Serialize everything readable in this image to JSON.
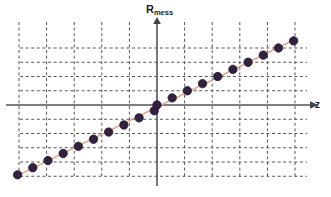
{
  "figure": {
    "background_color": "#ffffff",
    "width": 331,
    "height": 197
  },
  "labels": {
    "y_axis_main": "R",
    "y_axis_sub": "mess",
    "x_axis": "z"
  },
  "style": {
    "marker_color": "#32223f",
    "marker_edge_color": "#241830",
    "line_color": "#e9a183",
    "grid_color": "#555555",
    "axis_color": "#555555",
    "text_color": "#1a1a1a"
  },
  "chart_data": {
    "type": "scatter",
    "title": "",
    "xlabel": "z",
    "ylabel": "R_mess",
    "grid": true,
    "grid_style": "dashed",
    "legend": "none",
    "axes_cross_at_origin": true,
    "xlim": [
      -5.5,
      5.5
    ],
    "ylim": [
      -2.6,
      2.4
    ],
    "x_gridlines": [
      -5,
      -4,
      -3,
      -2,
      -1,
      0,
      1,
      2,
      3,
      4,
      5
    ],
    "y_gridlines": [
      -2.5,
      -2,
      -1.5,
      -1,
      -0.5,
      0,
      0.5,
      1,
      1.5,
      2
    ],
    "series": [
      {
        "name": "R_mess",
        "marker": "circle",
        "points": [
          {
            "x": -5.05,
            "y": -2.45
          },
          {
            "x": -4.5,
            "y": -2.2
          },
          {
            "x": -3.95,
            "y": -1.95
          },
          {
            "x": -3.4,
            "y": -1.7
          },
          {
            "x": -2.85,
            "y": -1.45
          },
          {
            "x": -2.3,
            "y": -1.2
          },
          {
            "x": -1.75,
            "y": -0.95
          },
          {
            "x": -1.2,
            "y": -0.7
          },
          {
            "x": -0.65,
            "y": -0.45
          },
          {
            "x": -0.1,
            "y": -0.2
          },
          {
            "x": 0.0,
            "y": 0.0
          },
          {
            "x": 0.55,
            "y": 0.25
          },
          {
            "x": 1.1,
            "y": 0.5
          },
          {
            "x": 1.65,
            "y": 0.75
          },
          {
            "x": 2.2,
            "y": 1.0
          },
          {
            "x": 2.75,
            "y": 1.25
          },
          {
            "x": 3.3,
            "y": 1.5
          },
          {
            "x": 3.85,
            "y": 1.75
          },
          {
            "x": 4.4,
            "y": 2.0
          },
          {
            "x": 4.95,
            "y": 2.25
          }
        ]
      }
    ],
    "trend_line": {
      "description": "straight line through all measured points",
      "x_start": -5.2,
      "y_start": -2.55,
      "x_end": 5.1,
      "y_end": 2.35
    }
  }
}
